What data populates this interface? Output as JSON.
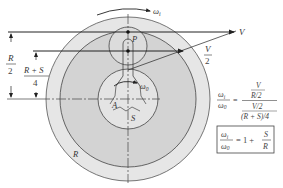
{
  "figure": {
    "colors": {
      "outer_disk": "#e6e6e6",
      "ring_region": "#d3d3d3",
      "sun": "#e4e4e4",
      "planet": "#d9d9d9",
      "line": "#222222",
      "outline": "#555555"
    },
    "labels": {
      "omega_i": "ω",
      "omega_i_sub": "i",
      "omega_o": "ω",
      "omega_o_sub": "0",
      "V": "V",
      "V_half_num": "V",
      "V_half_den": "2",
      "P": "P",
      "A": "A",
      "S": "S",
      "R": "R",
      "dim_R2_num": "R",
      "dim_R2_den": "2",
      "dim_RS4_num": "R + S",
      "dim_RS4_den": "4"
    },
    "equations": {
      "eq1_lhs_num": "ω",
      "eq1_lhs_num_sub": "i",
      "eq1_lhs_den": "ω",
      "eq1_lhs_den_sub": "0",
      "eq1_equals": "=",
      "eq1_rhs_top_num": "V",
      "eq1_rhs_top_den": "R/2",
      "eq1_rhs_bot_num": "V/2",
      "eq1_rhs_bot_den": "(R + S)/4",
      "eq2_lhs_num": "ω",
      "eq2_lhs_num_sub": "i",
      "eq2_lhs_den": "ω",
      "eq2_lhs_den_sub": "0",
      "eq2_rhs": "= 1 +",
      "eq2_frac_num": "S",
      "eq2_frac_den": "R"
    }
  }
}
